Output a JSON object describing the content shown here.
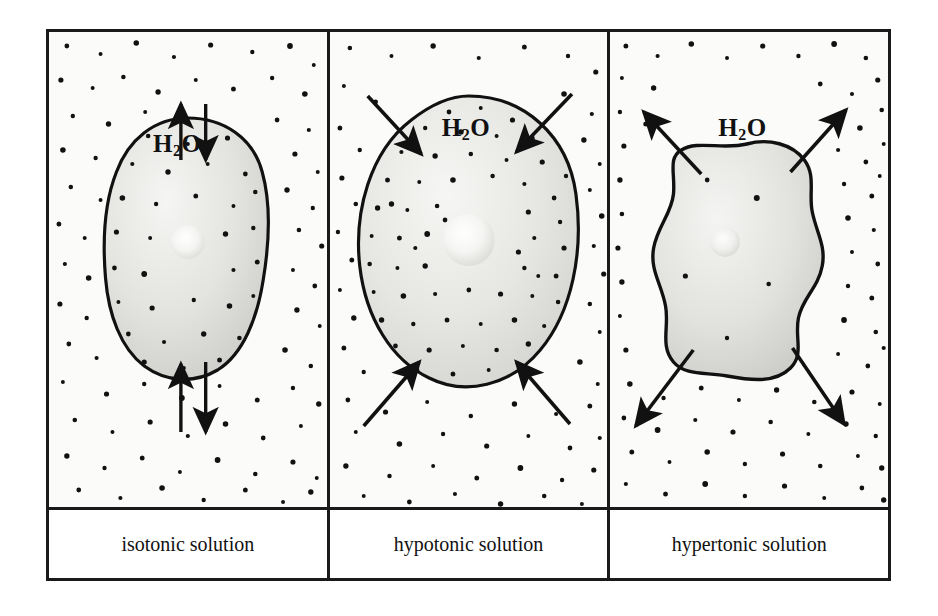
{
  "figure": {
    "frame_color": "#1a1a1a",
    "background_color": "#fbfbf9",
    "caption_background": "#ffffff"
  },
  "panels": [
    {
      "id": "isotonic",
      "caption": "isotonic solution",
      "water_label_html": "H<sub>2</sub>O",
      "water_label_text": "H2O",
      "cell": {
        "shape": "irregular-oval",
        "state": "normal",
        "fill_light": "#f2f2f0",
        "fill_dark": "#cfcfcb",
        "outline_color": "#111111",
        "nucleus_color": "#f7f7f5"
      },
      "arrows": {
        "direction": "bidirectional-equal",
        "description": "equal water movement in and out",
        "count": 4,
        "color": "#111111"
      },
      "dots": {
        "inside_density": "medium",
        "outside_density": "medium",
        "color": "#111111"
      }
    },
    {
      "id": "hypotonic",
      "caption": "hypotonic solution",
      "water_label_html": "H<sub>2</sub>O",
      "water_label_text": "H2O",
      "cell": {
        "shape": "round-swollen",
        "state": "swollen",
        "fill_light": "#f2f2f0",
        "fill_dark": "#d4d4d0",
        "outline_color": "#111111",
        "nucleus_color": "#f7f7f5"
      },
      "arrows": {
        "direction": "inward",
        "description": "net water movement into the cell",
        "count": 4,
        "color": "#111111"
      },
      "dots": {
        "inside_density": "high",
        "outside_density": "low",
        "color": "#111111"
      }
    },
    {
      "id": "hypertonic",
      "caption": "hypertonic solution",
      "water_label_html": "H<sub>2</sub>O",
      "water_label_text": "H2O",
      "cell": {
        "shape": "crenated-shrunken",
        "state": "shrunken",
        "fill_light": "#f2f2f0",
        "fill_dark": "#cdcdc9",
        "outline_color": "#111111",
        "nucleus_color": "#f5f5f3"
      },
      "arrows": {
        "direction": "outward",
        "description": "net water movement out of the cell",
        "count": 4,
        "color": "#111111"
      },
      "dots": {
        "inside_density": "very-low",
        "outside_density": "high",
        "color": "#111111"
      }
    }
  ]
}
